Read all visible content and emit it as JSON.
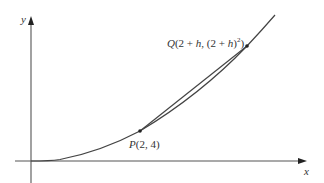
{
  "diagram": {
    "axes": {
      "x_label": "x",
      "y_label": "y"
    },
    "curve": {
      "equation": "y = x^2",
      "color": "#444444"
    },
    "points": {
      "P": {
        "name": "P",
        "label_rest": "(2, 4)",
        "coords": [
          2,
          4
        ]
      },
      "Q": {
        "name": "Q",
        "label_part1": "(2 + ",
        "label_h1": "h",
        "label_part2": ", (2 + ",
        "label_h2": "h",
        "label_part3": ")",
        "label_exp": "2",
        "label_part4": ")",
        "coords": [
          "2 + h",
          "(2 + h)^2"
        ]
      }
    },
    "secant": {
      "through": [
        "P",
        "Q"
      ],
      "color": "#444444"
    },
    "colors": {
      "axis": "#555555",
      "curve": "#444444",
      "text": "#333333",
      "background": "#ffffff"
    }
  }
}
